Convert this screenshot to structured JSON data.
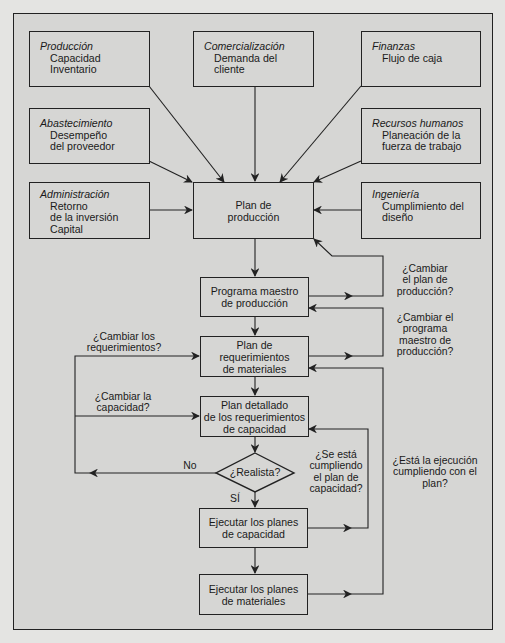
{
  "departments": {
    "produccion": {
      "title": "Producción",
      "lines": [
        "Capacidad",
        "Inventario"
      ]
    },
    "comercializacion": {
      "title": "Comercialización",
      "lines": [
        "Demanda del",
        "cliente"
      ]
    },
    "finanzas": {
      "title": "Finanzas",
      "lines": [
        "Flujo de caja"
      ]
    },
    "abastecimiento": {
      "title": "Abastecimiento",
      "lines": [
        "Desempeño",
        "del proveedor"
      ]
    },
    "recursos_humanos": {
      "title": "Recursos humanos",
      "lines": [
        "Planeación de la",
        "fuerza de trabajo"
      ]
    },
    "administracion": {
      "title": "Administración",
      "lines": [
        "Retorno",
        "de la inversión",
        "Capital"
      ]
    },
    "ingenieria": {
      "title": "Ingeniería",
      "lines": [
        "Cumplimiento del",
        "diseño"
      ]
    }
  },
  "process": {
    "plan_produccion": [
      "Plan de",
      "producción"
    ],
    "programa_maestro": [
      "Programa maestro",
      "de producción"
    ],
    "plan_requerimientos": [
      "Plan de",
      "requerimientos",
      "de materiales"
    ],
    "plan_detallado": [
      "Plan detallado",
      "de los requerimientos",
      "de capacidad"
    ],
    "decision": "¿Realista?",
    "ejecutar_capacidad": [
      "Ejecutar los planes",
      "de capacidad"
    ],
    "ejecutar_materiales": [
      "Ejecutar los planes",
      "de materiales"
    ]
  },
  "labels": {
    "no": "No",
    "si": "SÍ",
    "cambiar_plan_produccion": [
      "¿Cambiar",
      "el plan de",
      "producción?"
    ],
    "cambiar_programa_maestro": [
      "¿Cambiar el",
      "programa",
      "maestro de",
      "producción?"
    ],
    "cambiar_requerimientos": [
      "¿Cambiar los",
      "requerimientos?"
    ],
    "cambiar_capacidad": [
      "¿Cambiar la",
      "capacidad?"
    ],
    "cumpliendo_plan_capacidad": [
      "¿Se está",
      "cumpliendo",
      "el plan de",
      "capacidad?"
    ],
    "ejecucion_cumpliendo_plan": [
      "¿Está la ejecución",
      "cumpliendo con el",
      "plan?"
    ]
  },
  "colors": {
    "frame_bg": "#d6d6d4",
    "page_bg": "#e4e4e2",
    "line": "#222222"
  }
}
